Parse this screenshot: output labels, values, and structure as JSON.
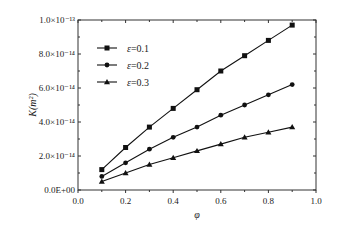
{
  "chart_data": {
    "type": "line",
    "title": "",
    "xlabel": "φ",
    "ylabel": "K(m²)",
    "xlim": [
      0.0,
      1.0
    ],
    "ylim": [
      0,
      1e-13
    ],
    "x_ticks": [
      "0.0",
      "0.2",
      "0.4",
      "0.6",
      "0.8",
      "1.0"
    ],
    "y_ticks": [
      "0.0E+00",
      "2.0×10⁻¹⁴",
      "4.0×10⁻¹⁴",
      "6.0×10⁻¹⁴",
      "8.0×10⁻¹⁴",
      "1.0×10⁻¹³"
    ],
    "grid": false,
    "legend_position": "upper left",
    "x": [
      0.1,
      0.2,
      0.3,
      0.4,
      0.5,
      0.6,
      0.7,
      0.8,
      0.9
    ],
    "series": [
      {
        "name": "ε=0.1",
        "marker": "square",
        "values": [
          1.2e-14,
          2.5e-14,
          3.7e-14,
          4.8e-14,
          5.9e-14,
          7e-14,
          7.9e-14,
          8.8e-14,
          9.7e-14
        ]
      },
      {
        "name": "ε=0.2",
        "marker": "circle",
        "values": [
          8e-15,
          1.6e-14,
          2.4e-14,
          3.1e-14,
          3.7e-14,
          4.4e-14,
          5e-14,
          5.6e-14,
          6.2e-14
        ]
      },
      {
        "name": "ε=0.3",
        "marker": "triangle",
        "values": [
          5e-15,
          1e-14,
          1.5e-14,
          1.9e-14,
          2.3e-14,
          2.7e-14,
          3.1e-14,
          3.4e-14,
          3.7e-14
        ]
      }
    ]
  },
  "labels": {
    "xlabel": "φ",
    "ylabel": "K(m²)",
    "legend": [
      "ε=0.1",
      "ε=0.2",
      "ε=0.3"
    ]
  }
}
